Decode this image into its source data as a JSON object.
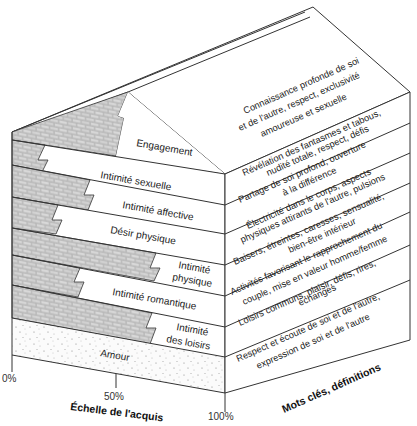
{
  "diagram": {
    "front_labels": [
      {
        "id": "engagement",
        "label": "Engagement"
      },
      {
        "id": "intimite-sexuelle",
        "label": "Intimité sexuelle"
      },
      {
        "id": "intimite-affective",
        "label": "Intimité affective"
      },
      {
        "id": "desir-physique",
        "label": "Désir physique"
      },
      {
        "id": "intimite-physique",
        "line1": "Intimité",
        "line2": "physique"
      },
      {
        "id": "intimite-romantique",
        "label": "Intimité romantique"
      },
      {
        "id": "intimite-loisirs",
        "line1": "Intimité",
        "line2": "des loisirs"
      },
      {
        "id": "amour",
        "label": "Amour"
      }
    ],
    "definitions": [
      {
        "id": "roof",
        "line1": "Connaissance profonde de soi",
        "line2": "et de l'autre, respect, exclusivité",
        "line3": "amoureuse et sexuelle"
      },
      {
        "id": "sexuelle",
        "line1": "Révélation des fantasmes et tabous,",
        "line2": "nudité totale, respect, défis"
      },
      {
        "id": "affective",
        "line1": "Partage de soi profond, ouverture",
        "line2": "à la différence"
      },
      {
        "id": "desir",
        "line1": "Électricité dans le corps, aspects",
        "line2": "physiques attirants de l'autre, pulsions"
      },
      {
        "id": "physique",
        "line1": "Baisers, étreintes, caresses, sensualité,",
        "line2": "bien-être intérieur"
      },
      {
        "id": "romantique",
        "line1": "Activités favorisant le rapprochement du",
        "line2": "couple, mise en valeur homme/femme"
      },
      {
        "id": "loisirs",
        "line1": "Loisirs communs, plaisir, défis, rires,",
        "line2": "échanges"
      },
      {
        "id": "amour",
        "line1": "Respect et écoute de soi et de l'autre,",
        "line2": "expression de soi et de l'autre"
      }
    ],
    "axis": {
      "tick_0": "0%",
      "tick_50": "50%",
      "tick_100": "100%",
      "x_title": "Échelle de l'acquis",
      "side_title": "Mots clés, définitions"
    },
    "colors": {
      "line": "#333333",
      "brick_fill": "#bdbdbd",
      "brick_mortar": "#f2f2f2",
      "background": "#ffffff"
    }
  }
}
